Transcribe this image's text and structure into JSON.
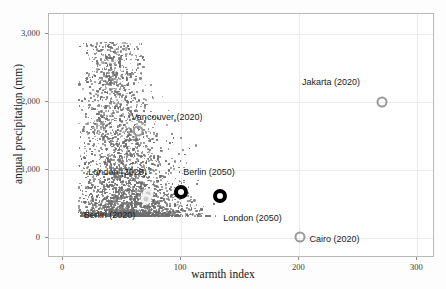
{
  "chart_data": {
    "type": "scatter",
    "title": "",
    "xlabel": "warmth index",
    "ylabel": "annual precipitation (mm)",
    "xlim": [
      -12,
      315
    ],
    "ylim": [
      -300,
      3300
    ],
    "xticks": [
      0,
      100,
      200,
      300
    ],
    "xticklabels": [
      "0",
      "100",
      "200",
      "300"
    ],
    "yticks": [
      0,
      1000,
      2000,
      3000
    ],
    "yticklabels": [
      "0",
      "1,000",
      "2,000",
      "3,000"
    ],
    "grid": true,
    "legend": "none",
    "background_series": {
      "name": "global climate cloud",
      "color": "#6e6e6e",
      "point_count": 4200,
      "description": "dense gray scatter plume of world locations, tapering upward from a broad base near warmth index 20-90 and precipitation 300-1200 up to a narrow tail near warmth index 30-55 and precipitation 2800"
    },
    "highlights": [
      {
        "label": "Jakarta (2020)",
        "x": 270,
        "y": 2000,
        "style": "gray",
        "label_dx": -80,
        "label_dy": -20
      },
      {
        "label": "Vancouver (2020)",
        "x": 63,
        "y": 1580,
        "style": "gray",
        "label_dx": -6,
        "label_dy": -14
      },
      {
        "label": "London (2020)",
        "x": 72,
        "y": 640,
        "style": "light",
        "label_dx": -60,
        "label_dy": -22
      },
      {
        "label": "Berlin (2020)",
        "x": 70,
        "y": 570,
        "style": "light",
        "label_dx": -62,
        "label_dy": 16
      },
      {
        "label": "Berlin (2050)",
        "x": 100,
        "y": 680,
        "style": "black",
        "label_dx": 2,
        "label_dy": -20
      },
      {
        "label": "London (2050)",
        "x": 133,
        "y": 620,
        "style": "black",
        "label_dx": 3,
        "label_dy": 22
      },
      {
        "label": "Cairo (2020)",
        "x": 201,
        "y": 10,
        "style": "gray",
        "label_dx": 9,
        "label_dy": 2
      }
    ]
  },
  "axes": {
    "x_title": "warmth index",
    "y_title": "annual precipitation (mm)"
  },
  "colors": {
    "cloud": "#6e6e6e",
    "highlight_black": "#000000",
    "highlight_gray": "#9a9a9a",
    "highlight_light": "#f2f2f2",
    "grid": "#ececec",
    "frame": "#b9b9b9"
  }
}
